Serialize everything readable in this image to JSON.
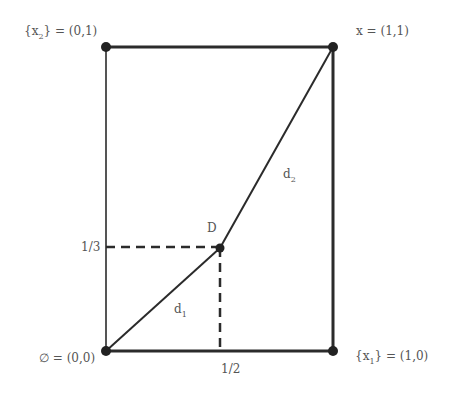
{
  "diagram": {
    "colors": {
      "line": "#2b2b2b",
      "text": "#555555",
      "background": "#ffffff"
    },
    "corners": {
      "top_left": {
        "label": "{x",
        "sub": "2",
        "suffix": "} = (0,1)"
      },
      "top_right": {
        "label": "x = (1,1)"
      },
      "bottom_left": {
        "label": "∅ = (0,0)"
      },
      "bottom_right": {
        "label": "{x",
        "sub": "1",
        "suffix": "} = (1,0)"
      }
    },
    "point_D": {
      "label": "D"
    },
    "segments": {
      "d1": {
        "label": "d",
        "sub": "1"
      },
      "d2": {
        "label": "d",
        "sub": "2"
      }
    },
    "ticks": {
      "y_tick": "1/3",
      "x_tick": "1/2"
    }
  }
}
